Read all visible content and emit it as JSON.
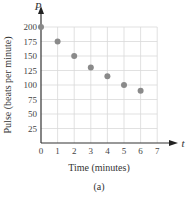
{
  "chart_data": {
    "type": "scatter",
    "title": "",
    "caption": "(a)",
    "xlabel": "Time (minutes)",
    "ylabel": "Pulse (beats per minute)",
    "x_axis_variable": "t",
    "y_axis_variable": "P",
    "xlim": [
      0,
      7
    ],
    "ylim": [
      0,
      200
    ],
    "x_ticks": [
      0,
      1,
      2,
      3,
      4,
      5,
      6,
      7
    ],
    "y_ticks": [
      25,
      50,
      75,
      100,
      125,
      150,
      175,
      200
    ],
    "grid": true,
    "legend": null,
    "series": [
      {
        "name": "Pulse",
        "x": [
          0,
          1,
          2,
          3,
          4,
          5,
          6
        ],
        "y": [
          200,
          175,
          150,
          130,
          115,
          100,
          90
        ],
        "color": "#8a8a8a"
      }
    ]
  },
  "labels": {
    "xlabel": "Time (minutes)",
    "ylabel": "Pulse (beats per minute)",
    "x_var": "t",
    "y_var": "P",
    "caption": "(a)"
  },
  "colors": {
    "grid": "#d9d9d9",
    "axis": "#333333",
    "point": "#8a8a8a"
  }
}
